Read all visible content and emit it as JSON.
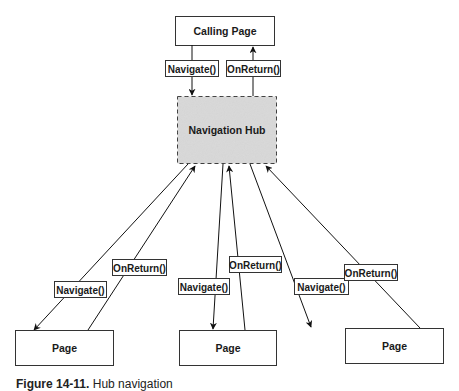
{
  "diagram": {
    "calling_page": {
      "label": "Calling Page"
    },
    "hub": {
      "label": "Navigation Hub",
      "fill": "#d9d9d9"
    },
    "top_navigate": {
      "label": "Navigate()"
    },
    "top_onreturn": {
      "label": "OnReturn()"
    },
    "pages": [
      {
        "label": "Page",
        "navigate_label": "Navigate()",
        "onreturn_label": "OnReturn()"
      },
      {
        "label": "Page",
        "navigate_label": "Navigate()",
        "onreturn_label": "OnReturn()"
      },
      {
        "label": "Page",
        "navigate_label": "Navigate()",
        "onreturn_label": "OnReturn()"
      }
    ]
  },
  "caption": {
    "figure": "Figure 14-11.",
    "text": "Hub navigation"
  }
}
